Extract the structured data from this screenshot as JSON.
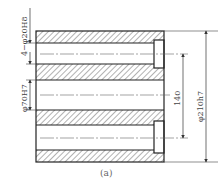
{
  "figure": {
    "caption": "(a)",
    "type": "section-view",
    "colors": {
      "outline": "#222222",
      "hatch": "#555555",
      "dimension": "#444444",
      "centerline": "#666666",
      "background": "#ffffff"
    }
  },
  "dimensions": {
    "small_holes": "4−φ20H8",
    "center_bore": "φ70H7",
    "hole_spacing": "140",
    "outer_diameter": "φ210h7"
  }
}
